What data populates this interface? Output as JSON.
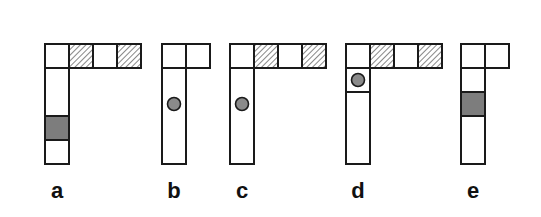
{
  "figure": {
    "cell_size": 24,
    "stroke_color": "#1a1a1a",
    "gray_fill": "#7d7d7d",
    "circle_fill": "#8a8a8a",
    "hatch_color": "#555555",
    "panels": [
      {
        "id": "a",
        "label": "a",
        "x": 45,
        "top_cells": [
          "empty",
          "hatched",
          "empty",
          "hatched"
        ],
        "column": [
          {
            "type": "empty",
            "span": 2
          },
          {
            "type": "gray"
          },
          {
            "type": "empty"
          }
        ]
      },
      {
        "id": "b",
        "label": "b",
        "x": 162,
        "top_cells": [
          "empty",
          "empty"
        ],
        "column": [
          {
            "type": "circle",
            "span": 4,
            "circle_offset": 1.5
          }
        ]
      },
      {
        "id": "c",
        "label": "c",
        "x": 230,
        "top_cells": [
          "empty",
          "hatched",
          "empty",
          "hatched"
        ],
        "column": [
          {
            "type": "circle",
            "span": 4,
            "circle_offset": 1.5
          }
        ]
      },
      {
        "id": "d",
        "label": "d",
        "x": 346,
        "top_cells": [
          "empty",
          "hatched",
          "empty",
          "hatched"
        ],
        "column": [
          {
            "type": "circle-cell"
          },
          {
            "type": "empty",
            "span": 3
          }
        ]
      },
      {
        "id": "e",
        "label": "e",
        "x": 461,
        "top_cells": [
          "empty",
          "empty"
        ],
        "column": [
          {
            "type": "empty"
          },
          {
            "type": "gray"
          },
          {
            "type": "empty",
            "span": 2
          }
        ]
      }
    ]
  }
}
